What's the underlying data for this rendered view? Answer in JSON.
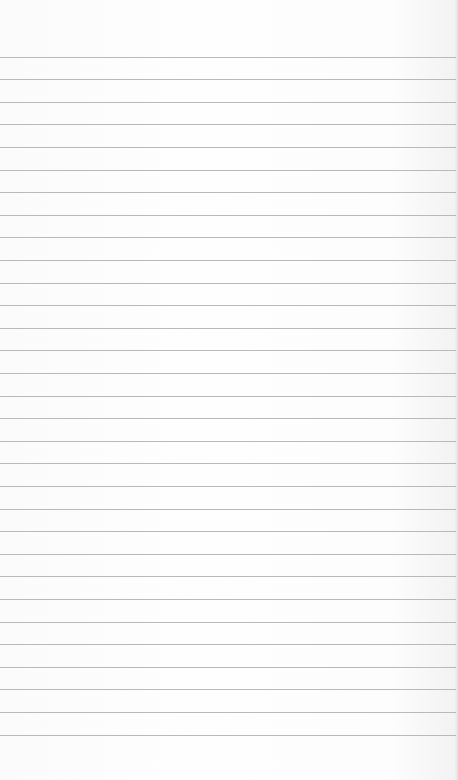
{
  "paper": {
    "type": "lined-paper",
    "background_color": "#fdfdfd",
    "rule_color": "#b9b9b9",
    "rule_count": 31,
    "first_rule_y": 56.5,
    "rule_spacing": 22.6
  }
}
